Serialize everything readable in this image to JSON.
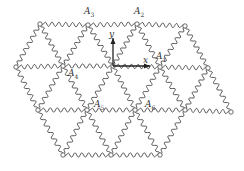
{
  "figure": {
    "line_color": "#444444",
    "background": "#ffffff"
  },
  "axes": {
    "x_label": "x",
    "y_label": "y",
    "origin": [
      113,
      66
    ],
    "x_end": [
      150,
      66
    ],
    "y_end": [
      113,
      38
    ]
  },
  "labels": [
    {
      "id": "A1",
      "base": "A",
      "sub": "1",
      "x": 156,
      "y": 52
    },
    {
      "id": "A2",
      "base": "A",
      "sub": "2",
      "x": 134,
      "y": 7
    },
    {
      "id": "A3",
      "base": "A",
      "sub": "3",
      "x": 84,
      "y": 7
    },
    {
      "id": "A4",
      "base": "A",
      "sub": "4",
      "x": 68,
      "y": 69
    },
    {
      "id": "A5",
      "base": "A",
      "sub": "5",
      "x": 94,
      "y": 100
    },
    {
      "id": "A6",
      "base": "A",
      "sub": "6",
      "x": 145,
      "y": 100
    }
  ],
  "nodes": [
    [
      40,
      24
    ],
    [
      88,
      25
    ],
    [
      137,
      24
    ],
    [
      185,
      26
    ],
    [
      16,
      67
    ],
    [
      63,
      66
    ],
    [
      113,
      66
    ],
    [
      160,
      67
    ],
    [
      208,
      68
    ],
    [
      38,
      110
    ],
    [
      87,
      110
    ],
    [
      135,
      110
    ],
    [
      185,
      110
    ],
    [
      231,
      112
    ],
    [
      63,
      155
    ],
    [
      111,
      155
    ],
    [
      160,
      155
    ]
  ],
  "edges": [
    [
      0,
      1
    ],
    [
      1,
      2
    ],
    [
      2,
      3
    ],
    [
      4,
      5
    ],
    [
      5,
      6
    ],
    [
      6,
      7
    ],
    [
      7,
      8
    ],
    [
      9,
      10
    ],
    [
      10,
      11
    ],
    [
      11,
      12
    ],
    [
      12,
      13
    ],
    [
      14,
      15
    ],
    [
      15,
      16
    ],
    [
      0,
      4
    ],
    [
      0,
      5
    ],
    [
      1,
      5
    ],
    [
      1,
      6
    ],
    [
      2,
      6
    ],
    [
      2,
      7
    ],
    [
      3,
      7
    ],
    [
      3,
      8
    ],
    [
      4,
      9
    ],
    [
      5,
      9
    ],
    [
      5,
      10
    ],
    [
      6,
      10
    ],
    [
      6,
      11
    ],
    [
      7,
      11
    ],
    [
      7,
      12
    ],
    [
      8,
      12
    ],
    [
      8,
      13
    ],
    [
      9,
      14
    ],
    [
      10,
      14
    ],
    [
      10,
      15
    ],
    [
      11,
      15
    ],
    [
      11,
      16
    ],
    [
      12,
      16
    ]
  ]
}
